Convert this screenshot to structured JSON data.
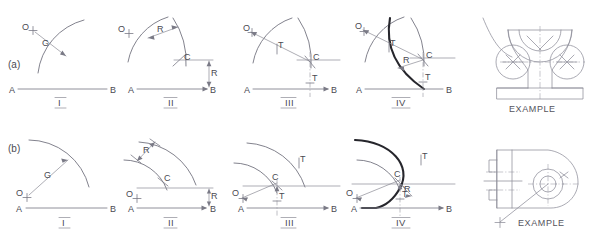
{
  "page": {
    "background": "#ffffff",
    "ink_light": "#8b8b95",
    "ink_dark": "#26262c"
  },
  "rows": [
    {
      "id": "a",
      "row_label": "(a)",
      "example_label": "EXAMPLE",
      "steps": [
        {
          "numeral": "I",
          "labels": {
            "line_start": "A",
            "line_end": "B",
            "center": "O",
            "gap": "G"
          },
          "annotations": [
            "O",
            "G",
            "A",
            "B"
          ]
        },
        {
          "numeral": "II",
          "labels": {
            "line_start": "A",
            "line_end": "B",
            "center": "O",
            "radius_top": "R",
            "radius_right": "R",
            "intersection": "C"
          },
          "annotations": [
            "O",
            "R",
            "C",
            "R",
            "A",
            "B"
          ]
        },
        {
          "numeral": "III",
          "labels": {
            "line_start": "A",
            "line_end": "B",
            "center": "O",
            "tangent_arc": "T",
            "tangent_line": "T",
            "intersection": "C"
          },
          "annotations": [
            "O",
            "T",
            "C",
            "T",
            "A",
            "B"
          ]
        },
        {
          "numeral": "IV",
          "labels": {
            "line_start": "A",
            "line_end": "B",
            "center": "O",
            "tangent_arc": "T",
            "tangent_line": "T",
            "intersection": "C",
            "radius": "R"
          },
          "annotations": [
            "O",
            "T",
            "C",
            "R",
            "T",
            "A",
            "B"
          ]
        }
      ]
    },
    {
      "id": "b",
      "row_label": "(b)",
      "example_label": "EXAMPLE",
      "steps": [
        {
          "numeral": "I",
          "labels": {
            "line_start": "A",
            "line_end": "B",
            "center": "O",
            "gap": "G"
          },
          "annotations": [
            "G",
            "O",
            "A",
            "B"
          ]
        },
        {
          "numeral": "II",
          "labels": {
            "line_start": "A",
            "line_end": "B",
            "center": "O",
            "radius_top": "R",
            "radius_right": "R",
            "intersection": "C"
          },
          "annotations": [
            "R",
            "C",
            "O",
            "R",
            "A",
            "B"
          ]
        },
        {
          "numeral": "III",
          "labels": {
            "line_start": "A",
            "line_end": "B",
            "center": "O",
            "tangent_arc": "T",
            "tangent_line": "T",
            "intersection": "C"
          },
          "annotations": [
            "T",
            "C",
            "O",
            "T",
            "A",
            "B"
          ]
        },
        {
          "numeral": "IV",
          "labels": {
            "line_start": "A",
            "line_end": "B",
            "center": "O",
            "tangent_arc": "T",
            "tangent_line": "T",
            "intersection": "C",
            "radius": "R"
          },
          "annotations": [
            "T",
            "C",
            "O",
            "R",
            "T",
            "A",
            "B"
          ]
        }
      ]
    }
  ]
}
